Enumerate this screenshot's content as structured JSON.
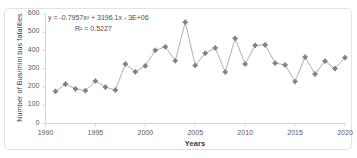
{
  "chart_data": {
    "type": "line",
    "title": "",
    "xlabel": "Years",
    "ylabel": "Number of Bus/mini bus fatalities",
    "xlim": [
      1990,
      2020
    ],
    "ylim": [
      0,
      600
    ],
    "xticks": [
      "1990",
      "1995",
      "2000",
      "2005",
      "2010",
      "2015",
      "2020"
    ],
    "yticks": [
      "0",
      "100",
      "200",
      "300",
      "400",
      "500",
      "600"
    ],
    "grid": false,
    "legend": "none",
    "marker": "diamond",
    "series_color": "#a6a6a6",
    "marker_color": "#808080",
    "trendline_color": "#404040",
    "x": [
      1991,
      1992,
      1993,
      1994,
      1995,
      1996,
      1997,
      1998,
      1999,
      2000,
      2001,
      2002,
      2003,
      2004,
      2005,
      2006,
      2007,
      2008,
      2009,
      2010,
      2011,
      2012,
      2013,
      2014,
      2015,
      2016,
      2017,
      2018,
      2019,
      2020
    ],
    "values": [
      176,
      216,
      190,
      180,
      233,
      199,
      183,
      326,
      283,
      316,
      401,
      420,
      344,
      555,
      318,
      385,
      414,
      282,
      466,
      326,
      428,
      431,
      331,
      321,
      230,
      364,
      271,
      342,
      301,
      361
    ],
    "series": [
      {
        "name": "Number of Bus/mini bus fatalities",
        "values": [
          176,
          216,
          190,
          180,
          233,
          199,
          183,
          326,
          283,
          316,
          401,
          420,
          344,
          555,
          318,
          385,
          414,
          282,
          466,
          326,
          428,
          431,
          331,
          321,
          230,
          364,
          271,
          342,
          301,
          361
        ]
      }
    ],
    "annotations": {
      "equation": "y = -0.7957x² + 3196.1x - 3E+06",
      "r_squared": "R² = 0.5227"
    },
    "trendline": {
      "type": "polynomial",
      "order": 2,
      "a": -0.7957,
      "b": 3196.1,
      "c": -3000000
    }
  }
}
